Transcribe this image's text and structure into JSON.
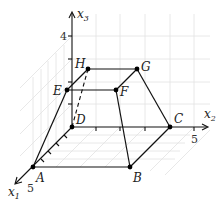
{
  "diagram": {
    "type": "3d-coordinate-figure",
    "axes": {
      "x1": {
        "label": "x",
        "sub": "1",
        "tick_label": "5"
      },
      "x2": {
        "label": "x",
        "sub": "2",
        "tick_label": "5"
      },
      "x3": {
        "label": "x",
        "sub": "3",
        "tick_label": "4"
      }
    },
    "points": [
      {
        "name": "A",
        "label": "A"
      },
      {
        "name": "B",
        "label": "B"
      },
      {
        "name": "C",
        "label": "C"
      },
      {
        "name": "D",
        "label": "D"
      },
      {
        "name": "E",
        "label": "E"
      },
      {
        "name": "F",
        "label": "F"
      },
      {
        "name": "G",
        "label": "G"
      },
      {
        "name": "H",
        "label": "H"
      }
    ],
    "edges": {
      "solid": [
        "A-B",
        "B-C",
        "A-D",
        "D-C",
        "E-F",
        "F-G",
        "H-G",
        "E-H",
        "A-E",
        "B-F",
        "C-G"
      ],
      "dashed": [
        "D-H"
      ]
    },
    "colors": {
      "line": "#111111",
      "grid": "#dcdcdc",
      "point": "#000000"
    }
  }
}
